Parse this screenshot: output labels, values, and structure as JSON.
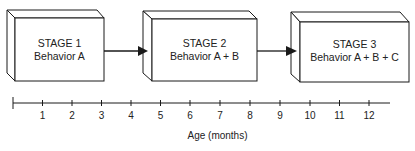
{
  "diagram": {
    "type": "stage-progression",
    "stages": [
      {
        "title": "STAGE 1",
        "behavior": "Behavior A"
      },
      {
        "title": "STAGE 2",
        "behavior": "Behavior A + B"
      },
      {
        "title": "STAGE 3",
        "behavior": "Behavior A + B + C"
      }
    ],
    "arrows": [
      {
        "from": "STAGE 1",
        "to": "STAGE 2"
      },
      {
        "from": "STAGE 2",
        "to": "STAGE 3"
      }
    ],
    "axis": {
      "title": "Age (months)",
      "ticks": [
        "1",
        "2",
        "3",
        "4",
        "5",
        "6",
        "7",
        "8",
        "9",
        "10",
        "11",
        "12"
      ]
    },
    "colors": {
      "line": "#1a1a1a",
      "fill": "#ffffff"
    }
  }
}
